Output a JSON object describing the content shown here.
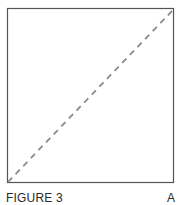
{
  "figure": {
    "caption": "FIGURE 3",
    "panel_label": "A",
    "square": {
      "x": 7,
      "y": 8,
      "width": 167,
      "height": 175,
      "stroke": "#555555"
    },
    "diagonal": {
      "from": "bottom-left",
      "to": "top-right",
      "style": "dashed",
      "stroke": "#8a8a8a"
    }
  }
}
